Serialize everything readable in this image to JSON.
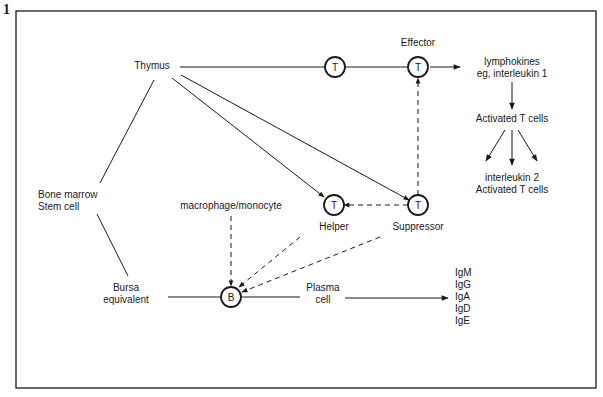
{
  "figure": {
    "number": "1"
  },
  "nodes": {
    "thymus": "Thymus",
    "effector": "Effector",
    "lymphokines_line1": "lymphokines",
    "lymphokines_line2": "eg, interleukin 1",
    "activated_t_cells": "Activated T cells",
    "interleukin2_line1": "interleukin 2",
    "interleukin2_line2": "Activated T cells",
    "bone_marrow_line1": "Bone marrow",
    "bone_marrow_line2": "Stem cell",
    "macrophage": "macrophage/monocyte",
    "helper": "Helper",
    "suppressor": "Suppressor",
    "bursa_line1": "Bursa",
    "bursa_line2": "equivalent",
    "plasma_line1": "Plasma",
    "plasma_line2": "cell"
  },
  "cells": {
    "t_cell": "T",
    "b_cell": "B"
  },
  "immunoglobulins": [
    "IgM",
    "IgG",
    "IgA",
    "IgD",
    "IgE"
  ],
  "colors": {
    "ink": "#1a1a1a",
    "background": "#ffffff"
  }
}
